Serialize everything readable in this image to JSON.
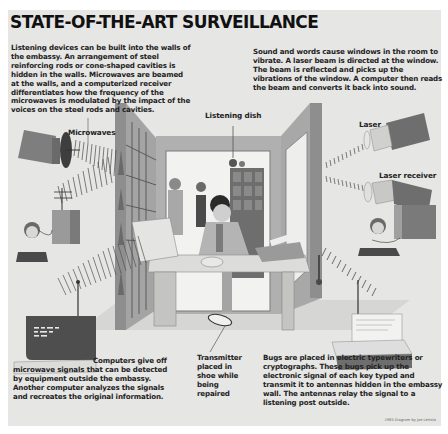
{
  "title": "STATE-OF-THE-ART SURVEILLANCE",
  "paragraphs": {
    "walls": "Listening devices can be built into the walls of the embassy. An arrangement of steel reinforcing rods or cone-shaped cavities is hidden in the walls. Microwaves are beamed at the walls, and a computerized receiver differentiates how the frequency of the microwaves is modulated by the impact of the voices on the steel rods and cavities.",
    "laser": "Sound and words cause windows in the room to vibrate. A laser beam is directed at the window. The beam is reflected and picks up the vibrations of the window. A computer then reads the beam and converts it back into sound.",
    "computers": "Computers give off microwave signals that can be detected by equipment outside the embassy. Another computer analyzes the signals and recreates the original information.",
    "shoe": "Transmitter placed in shoe while being repaired",
    "bugs": "Bugs are placed in electric typewriters or cryptographs. These bugs pick up the electronic signal of each key typed and transmit it to antennas hidden in the embassy wall. The antennas relay the signal to a listening post outside."
  },
  "labels": {
    "microwaves": "Microwaves",
    "listening_dish": "Listening dish",
    "laser": "Laser",
    "laser_receiver": "Laser receiver"
  },
  "credit": "1985 Diagram by Joe Lertola",
  "colors": {
    "paper": "#e6e6e4",
    "ink": "#1a1a1a",
    "wall_dark": "#8a8a8a",
    "wall_light": "#b8b8b8",
    "device_dark": "#5c5c5c"
  }
}
